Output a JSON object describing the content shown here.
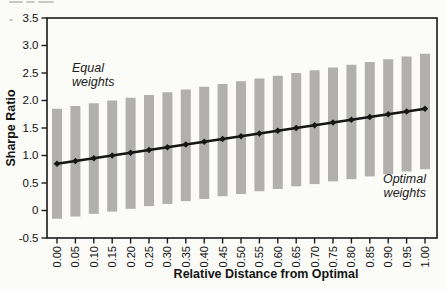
{
  "figure": {
    "background": "#fbfbf8"
  },
  "chart_data": {
    "type": "bar",
    "subtype": "floating-range-bars-with-line",
    "title": "",
    "xlabel": "Relative Distance from Optimal",
    "ylabel": "Sharpe Ratio",
    "x": [
      0.0,
      0.05,
      0.1,
      0.15,
      0.2,
      0.25,
      0.3,
      0.35,
      0.4,
      0.45,
      0.5,
      0.55,
      0.6,
      0.65,
      0.7,
      0.75,
      0.8,
      0.85,
      0.9,
      0.95,
      1.0
    ],
    "x_tick_labels": [
      "0.00",
      "0.05",
      "0.10",
      "0.15",
      "0.20",
      "0.25",
      "0.30",
      "0.35",
      "0.40",
      "0.45",
      "0.50",
      "0.55",
      "0.60",
      "0.65",
      "0.70",
      "0.75",
      "0.80",
      "0.85",
      "0.90",
      "0.95",
      "1.00"
    ],
    "series": [
      {
        "name": "Sharpe ratio",
        "type": "line",
        "marker": "diamond",
        "values": [
          0.85,
          0.9,
          0.95,
          1.0,
          1.05,
          1.1,
          1.15,
          1.2,
          1.25,
          1.3,
          1.35,
          1.4,
          1.45,
          1.5,
          1.55,
          1.6,
          1.65,
          1.7,
          1.75,
          1.8,
          1.85
        ]
      },
      {
        "name": "Range bar top",
        "type": "bar_top",
        "values": [
          1.85,
          1.9,
          1.95,
          2.0,
          2.05,
          2.1,
          2.15,
          2.2,
          2.25,
          2.3,
          2.35,
          2.4,
          2.45,
          2.5,
          2.55,
          2.6,
          2.65,
          2.7,
          2.75,
          2.8,
          2.85
        ]
      },
      {
        "name": "Range bar bottom",
        "type": "bar_bottom",
        "values": [
          -0.15,
          -0.11,
          -0.06,
          -0.02,
          0.03,
          0.08,
          0.12,
          0.17,
          0.21,
          0.26,
          0.3,
          0.35,
          0.39,
          0.44,
          0.48,
          0.53,
          0.57,
          0.62,
          0.66,
          0.71,
          0.75
        ]
      }
    ],
    "ylim": [
      -0.5,
      3.5
    ],
    "y_ticks": {
      "values": [
        3.5,
        3.0,
        2.5,
        2.0,
        1.5,
        1.0,
        0.5,
        0,
        -0.5
      ],
      "labels": [
        "3.5",
        "3.0",
        "2.5",
        "2.0",
        "1.5",
        "1.0",
        "0.5",
        "0",
        "-0.5"
      ]
    },
    "grid": false,
    "legend": "none",
    "annotations": [
      {
        "id": "equal-weights",
        "text": "Equal\nweights"
      },
      {
        "id": "optimal-weights",
        "text": "Optimal\nweights"
      }
    ],
    "colors": {
      "bar": "#b1b0ae",
      "line": "#161616",
      "frame": "#1a1a1a",
      "tick_text": "#111111"
    }
  }
}
